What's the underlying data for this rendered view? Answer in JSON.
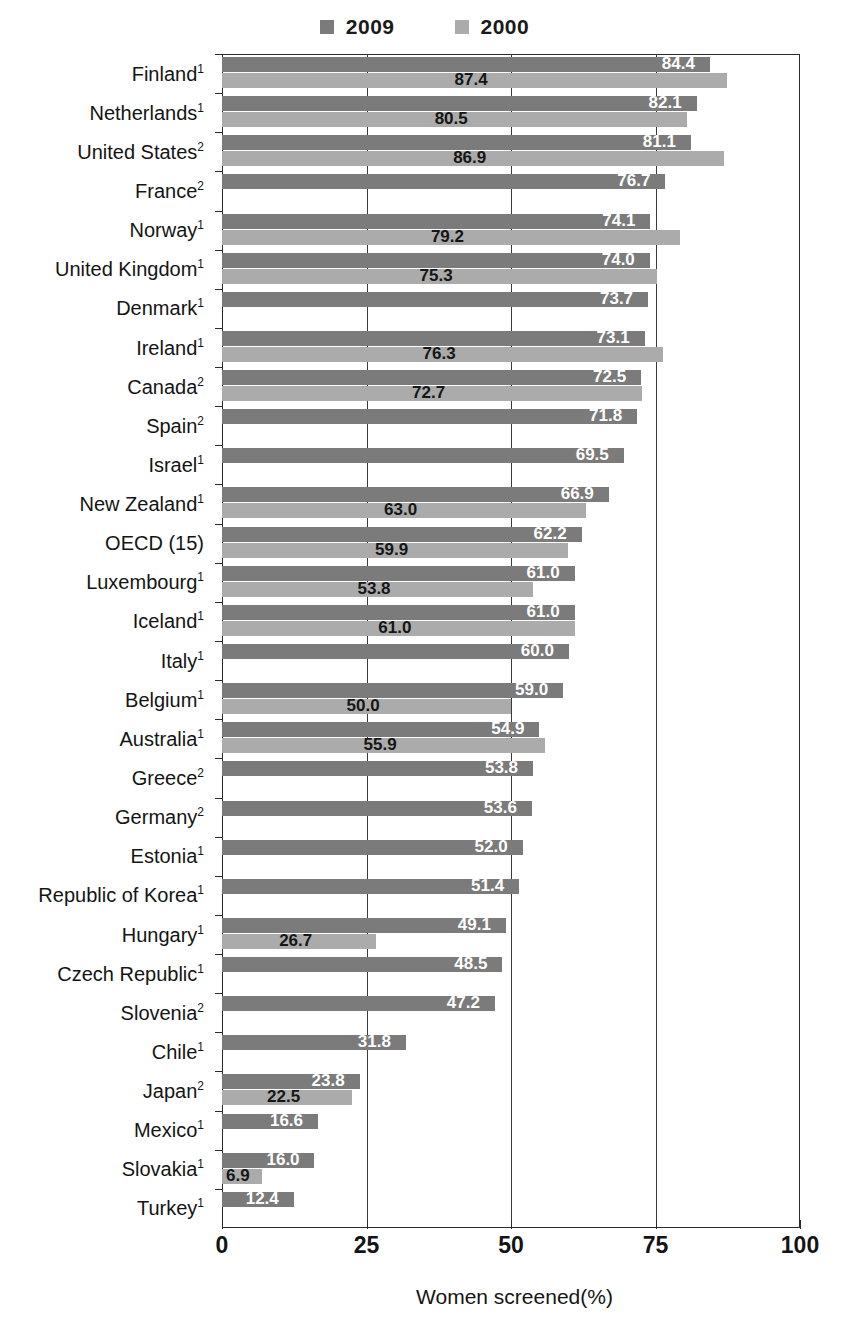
{
  "chart_data": {
    "type": "bar",
    "orientation": "horizontal",
    "title": "",
    "xlabel": "Women screened(%)",
    "ylabel": "",
    "xlim": [
      0,
      100
    ],
    "xticks": [
      0,
      25,
      50,
      75,
      100
    ],
    "grid": true,
    "legend_position": "top-center",
    "legend": [
      {
        "name": "2009",
        "color": "#7b7b7b"
      },
      {
        "name": "2000",
        "color": "#ababab"
      }
    ],
    "categories": [
      "Finland",
      "Netherlands",
      "United States",
      "France",
      "Norway",
      "United Kingdom",
      "Denmark",
      "Ireland",
      "Canada",
      "Spain",
      "Israel",
      "New Zealand",
      "OECD (15)",
      "Luxembourg",
      "Iceland",
      "Italy",
      "Belgium",
      "Australia",
      "Greece",
      "Germany",
      "Estonia",
      "Republic of Korea",
      "Hungary",
      "Czech Republic",
      "Slovenia",
      "Chile",
      "Japan",
      "Mexico",
      "Slovakia",
      "Turkey"
    ],
    "category_footnotes": [
      "1",
      "1",
      "2",
      "2",
      "1",
      "1",
      "1",
      "1",
      "2",
      "2",
      "1",
      "1",
      "",
      "1",
      "1",
      "1",
      "1",
      "1",
      "2",
      "2",
      "1",
      "1",
      "1",
      "1",
      "2",
      "1",
      "2",
      "1",
      "1",
      "1"
    ],
    "series": [
      {
        "name": "2009",
        "color": "#7b7b7b",
        "values": [
          84.4,
          82.1,
          81.1,
          76.7,
          74.1,
          74.0,
          73.7,
          73.1,
          72.5,
          71.8,
          69.5,
          66.9,
          62.2,
          61.0,
          61.0,
          60.0,
          59.0,
          54.9,
          53.8,
          53.6,
          52.0,
          51.4,
          49.1,
          48.5,
          47.2,
          31.8,
          23.8,
          16.6,
          16.0,
          12.4
        ]
      },
      {
        "name": "2000",
        "color": "#ababab",
        "values": [
          87.4,
          80.5,
          86.9,
          null,
          79.2,
          75.3,
          null,
          76.3,
          72.7,
          null,
          null,
          63.0,
          59.9,
          53.8,
          61.0,
          null,
          50.0,
          55.9,
          null,
          null,
          null,
          null,
          26.7,
          null,
          null,
          null,
          22.5,
          null,
          6.9,
          null
        ]
      }
    ]
  }
}
